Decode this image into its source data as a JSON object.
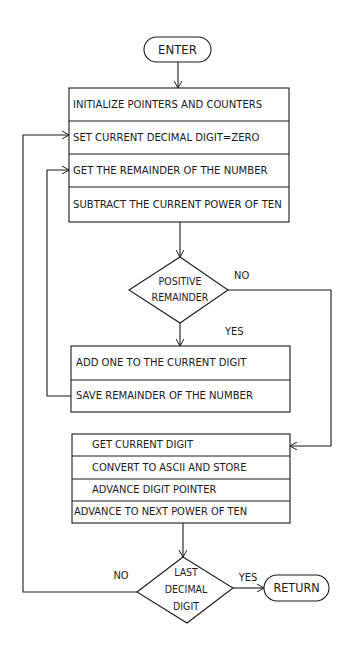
{
  "diagram": {
    "type": "flowchart",
    "style": "hand-drawn",
    "colors": {
      "ink": "#1a1a1a",
      "paper": "#ffffff"
    },
    "terminals": {
      "start": {
        "label": "ENTER"
      },
      "end": {
        "label": "RETURN"
      }
    },
    "process_groups": [
      {
        "id": "init",
        "steps": [
          "INITIALIZE POINTERS AND COUNTERS",
          "SET CURRENT DECIMAL DIGIT=ZERO",
          "GET THE REMAINDER OF THE NUMBER",
          "SUBTRACT THE CURRENT POWER OF TEN"
        ]
      },
      {
        "id": "increment",
        "steps": [
          "ADD ONE TO THE CURRENT DIGIT",
          "SAVE REMAINDER OF THE NUMBER"
        ]
      },
      {
        "id": "store",
        "steps": [
          "GET CURRENT DIGIT",
          "CONVERT TO ASCII AND STORE",
          "ADVANCE DIGIT POINTER",
          "ADVANCE TO NEXT POWER OF TEN"
        ]
      }
    ],
    "decisions": [
      {
        "id": "positive",
        "lines": [
          "POSITIVE",
          "REMAINDER"
        ],
        "yes": "YES",
        "no": "NO"
      },
      {
        "id": "last",
        "lines": [
          "LAST",
          "DECIMAL",
          "DIGIT"
        ],
        "yes": "YES",
        "no": "NO"
      }
    ]
  }
}
